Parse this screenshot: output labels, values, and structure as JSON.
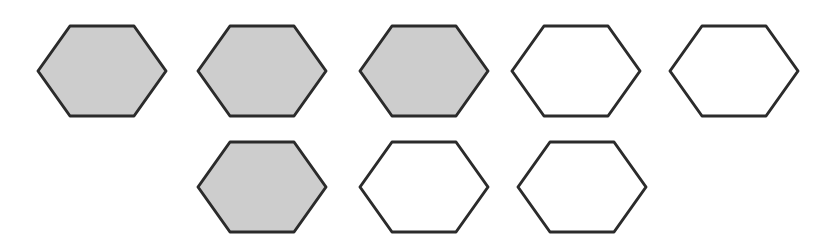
{
  "diagram": {
    "type": "hexagon-array",
    "colors": {
      "shaded_fill": "#cdcdcd",
      "unshaded_fill": "#ffffff",
      "stroke": "#2b2b2b",
      "background": "#ffffff"
    },
    "rows": [
      {
        "hexagons": [
          {
            "shaded": true,
            "x": 38,
            "y": 26
          },
          {
            "shaded": true,
            "x": 198,
            "y": 26
          },
          {
            "shaded": true,
            "x": 360,
            "y": 26
          },
          {
            "shaded": false,
            "x": 512,
            "y": 26
          },
          {
            "shaded": false,
            "x": 670,
            "y": 26
          }
        ]
      },
      {
        "hexagons": [
          {
            "shaded": true,
            "x": 198,
            "y": 142
          },
          {
            "shaded": false,
            "x": 360,
            "y": 142
          },
          {
            "shaded": false,
            "x": 518,
            "y": 142
          }
        ]
      }
    ],
    "counts": {
      "total": 8,
      "shaded": 4,
      "unshaded": 4
    },
    "hex_size": {
      "width": 128,
      "height": 90
    }
  }
}
